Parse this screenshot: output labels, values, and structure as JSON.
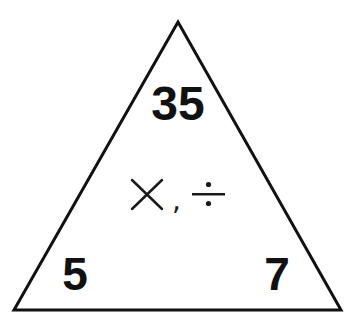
{
  "diagram": {
    "type": "fact-triangle",
    "top_value": "35",
    "bottom_left_value": "5",
    "bottom_right_value": "7",
    "operations": {
      "multiply_symbol": "×",
      "separator": ",",
      "divide_symbol": "÷"
    },
    "colors": {
      "stroke": "#111111",
      "background": "#ffffff"
    }
  }
}
